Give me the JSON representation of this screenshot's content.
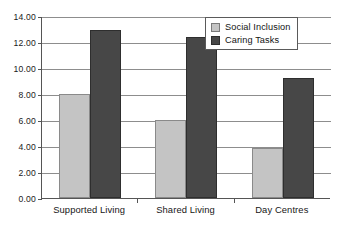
{
  "chart_data": {
    "type": "bar",
    "title": "",
    "subtitle": "",
    "xlabel": "",
    "ylabel": "",
    "categories": [
      "Supported Living",
      "Shared Living",
      "Day Centres"
    ],
    "series": [
      {
        "name": "Social Inclusion",
        "color": "#c4c4c4",
        "values": [
          8.0,
          6.0,
          3.85
        ]
      },
      {
        "name": "Caring Tasks",
        "color": "#474747",
        "values": [
          12.9,
          12.4,
          9.25
        ]
      }
    ],
    "ylim": [
      0,
      14
    ],
    "ytick_step": 2,
    "ytick_labels": [
      "0.00",
      "2.00",
      "4.00",
      "6.00",
      "8.00",
      "10.00",
      "12.00",
      "14.00"
    ],
    "ytick_values": [
      0,
      2,
      4,
      6,
      8,
      10,
      12,
      14
    ],
    "grid": true,
    "grid_axis": "y",
    "legend_position": "top-right",
    "legend_entries": [
      "Social Inclusion",
      "Caring Tasks"
    ]
  },
  "style": {
    "background": "#ffffff",
    "axis_color": "#555555",
    "grid_color": "#8d8d8d",
    "text_color": "#161616",
    "series_light": "#c4c4c4",
    "series_dark": "#474747"
  }
}
